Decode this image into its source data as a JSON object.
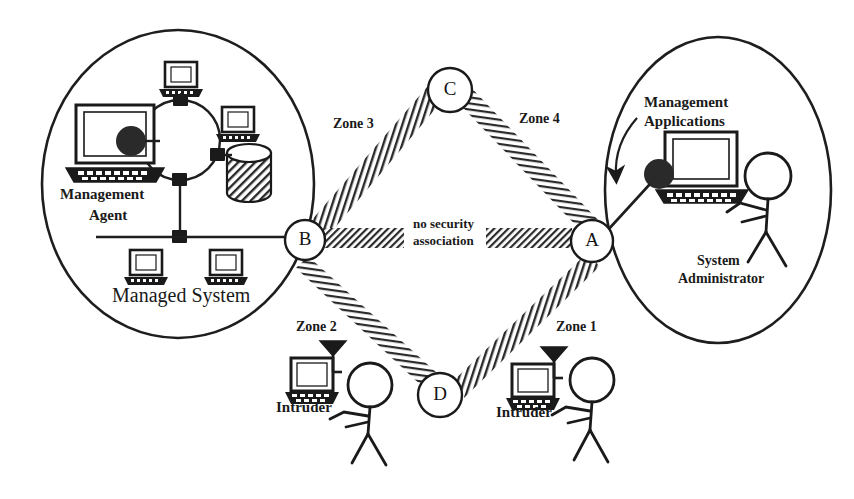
{
  "figure": {
    "background_color": "#ffffff",
    "ink_color": "#1a1a1a",
    "width": 854,
    "height": 499
  },
  "nodes": [
    {
      "id": "A",
      "label": "A",
      "cx": 592,
      "cy": 241,
      "r": 21
    },
    {
      "id": "B",
      "label": "B",
      "cx": 305,
      "cy": 240,
      "r": 20
    },
    {
      "id": "C",
      "label": "C",
      "cx": 450,
      "cy": 90,
      "r": 22
    },
    {
      "id": "D",
      "label": "D",
      "cx": 440,
      "cy": 395,
      "r": 22
    }
  ],
  "zones": [
    {
      "id": "zone1",
      "label": "Zone 1",
      "x": 556,
      "y": 325
    },
    {
      "id": "zone2",
      "label": "Zone 2",
      "x": 296,
      "y": 325
    },
    {
      "id": "zone3",
      "label": "Zone 3",
      "x": 333,
      "y": 127
    },
    {
      "id": "zone4",
      "label": "Zone 4",
      "x": 519,
      "y": 122
    }
  ],
  "center_note": {
    "line1": "no security",
    "line2": "association",
    "x": 413,
    "y": 226
  },
  "left_group": {
    "name": "Managed System",
    "caption": "Managed System",
    "caption_x": 112,
    "caption_y": 298,
    "agent_label_line1": "Management",
    "agent_label_line2": "Agent",
    "agent_label_x": 60,
    "agent_label_y": 196,
    "ellipse": {
      "cx": 178,
      "cy": 184,
      "rx": 136,
      "ry": 154
    }
  },
  "right_group": {
    "name": "Management Applications",
    "apps_label_line1": "Management",
    "apps_label_line2": "Applications",
    "apps_label_x": 644,
    "apps_label_y": 108,
    "admin_label_line1": "System",
    "admin_label_line2": "Administrator",
    "admin_label_x": 690,
    "admin_label_y": 265,
    "ellipse": {
      "cx": 718,
      "cy": 190,
      "rx": 113,
      "ry": 153
    }
  },
  "intruders": [
    {
      "id": "intruder-left",
      "label": "Intruder",
      "x": 276,
      "y": 407,
      "zone": "Zone 2"
    },
    {
      "id": "intruder-right",
      "label": "Intruder",
      "x": 496,
      "y": 412,
      "zone": "Zone 1"
    }
  ],
  "bands": [
    {
      "id": "band-b-c",
      "from": "B",
      "to": "C",
      "style": "vertical-hatch",
      "description": "security association between B and C"
    },
    {
      "id": "band-c-a",
      "from": "C",
      "to": "A",
      "style": "horizontal-hatch",
      "description": "security association between C and A"
    },
    {
      "id": "band-b-d",
      "from": "B",
      "to": "D",
      "style": "horizontal-hatch",
      "description": "security association between B and D"
    },
    {
      "id": "band-d-a",
      "from": "D",
      "to": "A",
      "style": "vertical-hatch",
      "description": "security association between D and A"
    },
    {
      "id": "band-b-a",
      "from": "B",
      "to": "A",
      "style": "diagonal-hatch",
      "description": "no security association between B and A"
    }
  ],
  "icons": {
    "workstation": "workstation-icon",
    "database": "database-cylinder-icon",
    "token_ring": "token-ring-network-icon",
    "antenna": "antenna-icon",
    "stick_figure": "person-stick-figure-icon",
    "blob": "processing-blob-icon",
    "arrow": "callout-arrow-icon"
  }
}
